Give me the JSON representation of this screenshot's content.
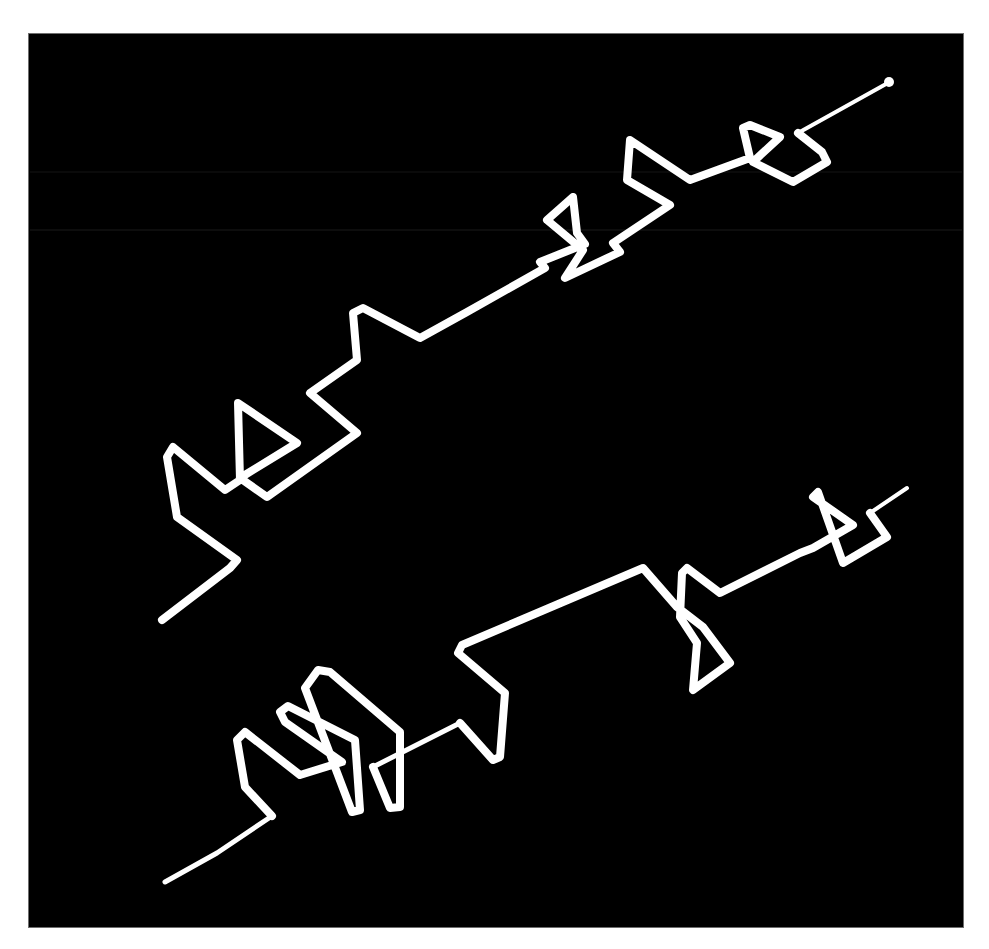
{
  "figure": {
    "caption": "",
    "background_color": "#ffffff",
    "panel": {
      "color": "#000000",
      "border_color": "#6e6e6e",
      "x": 29,
      "y": 34,
      "width": 934,
      "height": 893
    },
    "stroke_color": "#ffffff",
    "strokes": [
      {
        "name": "upper-scribble",
        "width": 8,
        "points": "162,620 230,568 237,560 177,517 167,457 173,447 225,490 240,480 238,403 297,443 240,478 267,497 357,433 310,393 357,360 353,313 363,308 420,338 467,312 545,268 540,262 585,244 577,233 573,197 547,220 583,250 565,278 620,252 613,243 670,205 627,180 630,140 690,180 750,158 743,128 750,125 780,137 753,162 793,182 827,162 822,152 798,133"
      },
      {
        "name": "upper-scribble-tail",
        "width": 4,
        "points": "798,133 886,84"
      },
      {
        "name": "lower-scribble",
        "width": 8,
        "points": "272,816 245,787 237,740 245,732 300,775 342,762 285,722 280,712 288,706 355,740 360,810 352,812 305,688 318,670 330,672 400,732 400,807 390,808 373,767"
      },
      {
        "name": "lower-scribble-start",
        "width": 5,
        "points": "165,882 217,853 272,816"
      },
      {
        "name": "lower-scribble-middle",
        "width": 5,
        "points": "373,767 460,723"
      },
      {
        "name": "lower-scribble-right",
        "width": 8,
        "points": "460,723 493,760 500,757 505,693 458,653 462,645 643,568 677,607 703,627 730,663 693,690 697,643 680,617 682,573 687,568 720,593 800,553 813,548 853,525 813,497 818,492 843,563 887,537 870,513"
      },
      {
        "name": "lower-scribble-tail",
        "width": 4,
        "points": "870,513 907,488"
      }
    ],
    "endpoint_dot": {
      "cx": 889,
      "cy": 82,
      "r": 5
    },
    "scan_artifacts": [
      {
        "y": 172,
        "color": "#3a3a3a"
      },
      {
        "y": 230,
        "color": "#4a4a4a"
      }
    ]
  }
}
